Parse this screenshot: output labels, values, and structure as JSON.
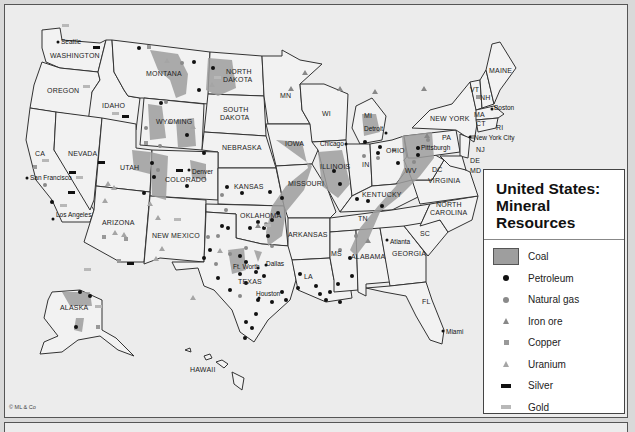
{
  "title": {
    "line1": "United States:",
    "line2": "Mineral Resources"
  },
  "legend": {
    "items": [
      {
        "key": "coal",
        "label": "Coal",
        "icon": "gray-area-swatch"
      },
      {
        "key": "petroleum",
        "label": "Petroleum",
        "icon": "black-dot"
      },
      {
        "key": "natural_gas",
        "label": "Natural gas",
        "icon": "gray-dot"
      },
      {
        "key": "iron_ore",
        "label": "Iron ore",
        "icon": "dark-gray-triangle"
      },
      {
        "key": "copper",
        "label": "Copper",
        "icon": "gray-square"
      },
      {
        "key": "uranium",
        "label": "Uranium",
        "icon": "light-gray-triangle"
      },
      {
        "key": "silver",
        "label": "Silver",
        "icon": "black-bar"
      },
      {
        "key": "gold",
        "label": "Gold",
        "icon": "light-gray-bar"
      }
    ]
  },
  "states": {
    "washington": "WASHINGTON",
    "oregon": "OREGON",
    "idaho": "IDAHO",
    "montana": "MONTANA",
    "wyoming": "WYOMING",
    "north_dakota_1": "NORTH",
    "north_dakota_2": "DAKOTA",
    "south_dakota_1": "SOUTH",
    "south_dakota_2": "DAKOTA",
    "nebraska": "NEBRASKA",
    "ca": "CA",
    "nevada": "NEVADA",
    "utah": "UTAH",
    "colorado": "COLORADO",
    "kansas": "KANSAS",
    "arizona": "ARIZONA",
    "new_mexico": "NEW MEXICO",
    "oklahoma": "OKLAHOMA",
    "texas": "TEXAS",
    "mn": "MN",
    "iowa": "IOWA",
    "missouri": "MISSOURI",
    "arkansas": "ARKANSAS",
    "la": "LA",
    "wi": "WI",
    "illinois": "ILLINOIS",
    "mi": "MI",
    "in": "IN",
    "ohio": "OHIO",
    "kentucky": "KENTUCKY",
    "tn": "TN",
    "ms": "MS",
    "alabama": "ALABAMA",
    "georgia": "GEORGIA",
    "fl": "FL",
    "sc": "SC",
    "north_carolina_1": "NORTH",
    "north_carolina_2": "CAROLINA",
    "virginia": "VIRGINIA",
    "wv": "WV",
    "pa": "PA",
    "new_york": "NEW YORK",
    "vt": "VT",
    "nh": "NH",
    "maine": "MAINE",
    "ma": "MA",
    "ct": "CT",
    "ri": "RI",
    "nj": "NJ",
    "de": "DE",
    "md": "MD",
    "dc": "DC",
    "alaska": "ALASKA",
    "hawaii": "HAWAII"
  },
  "cities": {
    "seattle": "Seattle",
    "san_francisco": "San Francisco",
    "los_angeles": "Los Angeles",
    "denver": "Denver",
    "chicago": "Chicago",
    "detroit": "Detroit",
    "pittsburgh": "Pittsburgh",
    "boston": "Boston",
    "new_york_city": "New York City",
    "atlanta": "Atlanta",
    "ft_worth": "Ft. Worth",
    "dallas": "Dallas",
    "houston": "Houston",
    "miami": "Miami"
  },
  "copyright": "© ML & Co",
  "colors": {
    "coal": "#9e9e9e",
    "petroleum": "#111111",
    "natural_gas": "#8a8a8a",
    "iron_ore": "#888888",
    "copper": "#999999",
    "uranium": "#a5a5a5",
    "silver": "#111111",
    "gold": "#b8b8b8",
    "land": "#f2f2f2",
    "water": "#ececec"
  }
}
